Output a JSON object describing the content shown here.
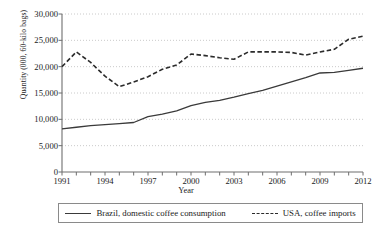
{
  "chart_data": {
    "type": "line",
    "title": "",
    "xlabel": "Year",
    "ylabel": "Quantity (000, 60-kilo bags)",
    "xlim": [
      1991,
      2012
    ],
    "ylim": [
      0,
      30000
    ],
    "ytick_interval": 5000,
    "grid": true,
    "grid_style": "dotted-horizontal",
    "legend_position": "bottom",
    "x": [
      1991,
      1992,
      1993,
      1994,
      1995,
      1996,
      1997,
      1998,
      1999,
      2000,
      2001,
      2002,
      2003,
      2004,
      2005,
      2006,
      2007,
      2008,
      2009,
      2010,
      2011,
      2012
    ],
    "ytick_labels": [
      "0",
      "5,000",
      "10,000",
      "15,000",
      "20,000",
      "25,000",
      "30,000"
    ],
    "ytick_values": [
      0,
      5000,
      10000,
      15000,
      20000,
      25000,
      30000
    ],
    "xtick_labels": [
      "1991",
      "1994",
      "1997",
      "2000",
      "2003",
      "2006",
      "2009",
      "2012"
    ],
    "xtick_values": [
      1991,
      1994,
      1997,
      2000,
      2003,
      2006,
      2009,
      2012
    ],
    "series": [
      {
        "name": "Brazil, domestic coffee consumption",
        "style": "solid",
        "color": "#3a3a3a",
        "values": [
          8200,
          8500,
          8800,
          9000,
          9200,
          9400,
          10500,
          11000,
          11600,
          12600,
          13200,
          13600,
          14200,
          14900,
          15500,
          16300,
          17100,
          17900,
          18800,
          18900,
          19300,
          19700
        ]
      },
      {
        "name": "USA, coffee imports",
        "style": "dashed",
        "color": "#2b2b2b",
        "values": [
          20000,
          22800,
          20800,
          18200,
          16200,
          17100,
          18100,
          19500,
          20300,
          22400,
          22100,
          21700,
          21400,
          22800,
          22800,
          22800,
          22700,
          22200,
          22800,
          23300,
          25200,
          25800
        ]
      }
    ]
  },
  "legend": {
    "items": [
      {
        "label": "Brazil, domestic coffee consumption",
        "style": "solid"
      },
      {
        "label": "USA, coffee imports",
        "style": "dashed"
      }
    ]
  }
}
